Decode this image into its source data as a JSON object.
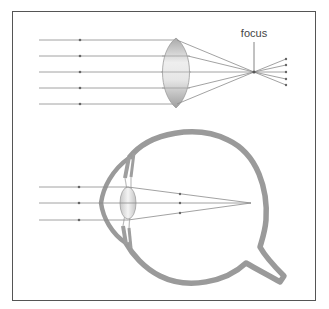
{
  "diagram": {
    "title": "",
    "lens_section": {
      "focus_label": "focus",
      "incoming_rays": 5,
      "outgoing_rays": 5
    },
    "eye_section": {
      "incoming_rays": 3
    }
  },
  "colors": {
    "frame": "#555555",
    "ray": "#888888",
    "eye_wall": "#999999",
    "lens_light": "#f2f2f2",
    "lens_dark": "#b5b5b5",
    "label": "#444444"
  }
}
